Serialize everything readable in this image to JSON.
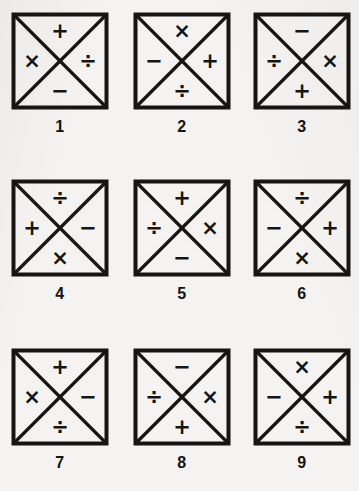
{
  "page": {
    "background_color": "#f4f3f1",
    "ink_color": "#161514",
    "columns": 3,
    "rows": 3
  },
  "figures": [
    {
      "label": "1",
      "top": "+",
      "left": "×",
      "right": "÷",
      "bottom": "−",
      "symbol_names": {
        "top": "plus-sign",
        "left": "multiplication-sign",
        "right": "division-sign",
        "bottom": "minus-sign"
      }
    },
    {
      "label": "2",
      "top": "×",
      "left": "−",
      "right": "+",
      "bottom": "÷",
      "symbol_names": {
        "top": "multiplication-sign",
        "left": "minus-sign",
        "right": "plus-sign",
        "bottom": "division-sign"
      }
    },
    {
      "label": "3",
      "top": "−",
      "left": "÷",
      "right": "×",
      "bottom": "+",
      "symbol_names": {
        "top": "minus-sign",
        "left": "division-sign",
        "right": "multiplication-sign",
        "bottom": "plus-sign"
      }
    },
    {
      "label": "4",
      "top": "÷",
      "left": "+",
      "right": "−",
      "bottom": "×",
      "symbol_names": {
        "top": "division-sign",
        "left": "plus-sign",
        "right": "minus-sign",
        "bottom": "multiplication-sign"
      }
    },
    {
      "label": "5",
      "top": "+",
      "left": "÷",
      "right": "×",
      "bottom": "−",
      "symbol_names": {
        "top": "plus-sign",
        "left": "division-sign",
        "right": "multiplication-sign",
        "bottom": "minus-sign"
      }
    },
    {
      "label": "6",
      "top": "÷",
      "left": "−",
      "right": "+",
      "bottom": "×",
      "symbol_names": {
        "top": "division-sign",
        "left": "minus-sign",
        "right": "plus-sign",
        "bottom": "multiplication-sign"
      }
    },
    {
      "label": "7",
      "top": "+",
      "left": "×",
      "right": "−",
      "bottom": "÷",
      "symbol_names": {
        "top": "plus-sign",
        "left": "multiplication-sign",
        "right": "minus-sign",
        "bottom": "division-sign"
      }
    },
    {
      "label": "8",
      "top": "−",
      "left": "÷",
      "right": "×",
      "bottom": "+",
      "symbol_names": {
        "top": "minus-sign",
        "left": "division-sign",
        "right": "multiplication-sign",
        "bottom": "plus-sign"
      }
    },
    {
      "label": "9",
      "top": "×",
      "left": "−",
      "right": "+",
      "bottom": "÷",
      "symbol_names": {
        "top": "multiplication-sign",
        "left": "minus-sign",
        "right": "plus-sign",
        "bottom": "division-sign"
      }
    }
  ]
}
